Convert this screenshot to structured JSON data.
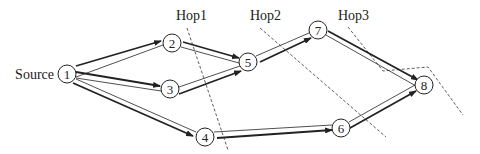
{
  "diagram": {
    "source_label": "Source",
    "hops": [
      {
        "label": "Hop1"
      },
      {
        "label": "Hop2"
      },
      {
        "label": "Hop3"
      }
    ],
    "nodes": [
      {
        "id": "1",
        "label": "1"
      },
      {
        "id": "2",
        "label": "2"
      },
      {
        "id": "3",
        "label": "3"
      },
      {
        "id": "4",
        "label": "4"
      },
      {
        "id": "5",
        "label": "5"
      },
      {
        "id": "6",
        "label": "6"
      },
      {
        "id": "7",
        "label": "7"
      },
      {
        "id": "8",
        "label": "8"
      }
    ],
    "edges": [
      {
        "from": "1",
        "to": "2"
      },
      {
        "from": "1",
        "to": "3"
      },
      {
        "from": "1",
        "to": "4"
      },
      {
        "from": "2",
        "to": "5"
      },
      {
        "from": "3",
        "to": "5"
      },
      {
        "from": "5",
        "to": "7"
      },
      {
        "from": "4",
        "to": "6"
      },
      {
        "from": "7",
        "to": "8"
      },
      {
        "from": "6",
        "to": "8"
      }
    ],
    "colors": {
      "stroke": "#222222",
      "background": "#ffffff"
    }
  }
}
